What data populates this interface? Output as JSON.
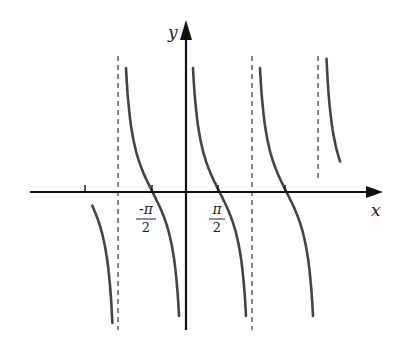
{
  "chart_data": {
    "type": "line",
    "title": "",
    "function": "y = cot(x) (period π, asymptotes at x = kπ)",
    "xlabel": "x",
    "ylabel": "y",
    "x_tick_labels": [
      {
        "position": "-π/2",
        "numerator": "-π",
        "denominator": "2"
      },
      {
        "position": "π/2",
        "numerator": "π",
        "denominator": "2"
      }
    ],
    "x_ticks": [
      "-π",
      "-π/2",
      "π/2",
      "π"
    ],
    "asymptotes": [
      "-π",
      "0",
      "π",
      "2π"
    ],
    "zeros": [
      "-3π/2",
      "-π/2",
      "π/2",
      "3π/2"
    ],
    "xlim": [
      "-7π/4",
      "5π/2"
    ],
    "grid": false,
    "legend": null,
    "colors": {
      "curve": "#444444",
      "axes": "#111111",
      "asymptote": "#555555"
    }
  },
  "labels": {
    "x_axis": "x",
    "y_axis": "y",
    "neg_half_pi_num": "-π",
    "neg_half_pi_den": "2",
    "half_pi_num": "π",
    "half_pi_den": "2"
  }
}
